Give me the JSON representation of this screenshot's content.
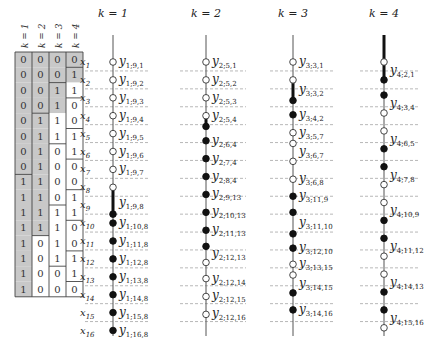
{
  "table": {
    "headers": [
      "k = 1",
      "k = 2",
      "k = 3",
      "k = 4"
    ],
    "rows": [
      [
        0,
        0,
        0,
        0
      ],
      [
        0,
        0,
        0,
        1
      ],
      [
        0,
        0,
        1,
        1
      ],
      [
        0,
        0,
        1,
        0
      ],
      [
        0,
        1,
        1,
        0
      ],
      [
        0,
        1,
        1,
        1
      ],
      [
        0,
        1,
        0,
        1
      ],
      [
        0,
        1,
        0,
        0
      ],
      [
        1,
        1,
        0,
        0
      ],
      [
        1,
        1,
        0,
        1
      ],
      [
        1,
        1,
        1,
        1
      ],
      [
        1,
        1,
        1,
        0
      ],
      [
        1,
        0,
        1,
        0
      ],
      [
        1,
        0,
        1,
        1
      ],
      [
        1,
        0,
        0,
        1
      ],
      [
        1,
        0,
        0,
        0
      ]
    ],
    "shade_color": "#c8c8c8"
  },
  "x_labels": [
    "x1",
    "x2",
    "x3",
    "x4",
    "x5",
    "x6",
    "x7",
    "x8",
    "x9",
    "x10",
    "x11",
    "x12",
    "x13",
    "x14",
    "x15",
    "x16"
  ],
  "columns": [
    {
      "title": "k = 1",
      "nodes": [
        {
          "row": 1,
          "type": "open",
          "label": "y1;9,1"
        },
        {
          "row": 2,
          "type": "open",
          "label": "y1;9,2"
        },
        {
          "row": 3,
          "type": "open",
          "label": "y1;9,3"
        },
        {
          "row": 4,
          "type": "open",
          "label": "y1;9,4"
        },
        {
          "row": 5,
          "type": "open",
          "label": "y1;9,5"
        },
        {
          "row": 6,
          "type": "open",
          "label": "y1;9,6"
        },
        {
          "row": 7,
          "type": "open",
          "label": "y1;9,7"
        },
        {
          "row": 8,
          "type": "open",
          "label": ""
        },
        {
          "row": 8.9,
          "type": "none",
          "label": "y1;9,8"
        },
        {
          "row": 9.5,
          "type": "filled",
          "label": ""
        },
        {
          "row": 10,
          "type": "filled",
          "label": "y1;10,8"
        },
        {
          "row": 11,
          "type": "filled",
          "label": "y1;11,8"
        },
        {
          "row": 12,
          "type": "filled",
          "label": "y1;12,8"
        },
        {
          "row": 13,
          "type": "filled",
          "label": "y1;13,8"
        },
        {
          "row": 14,
          "type": "filled",
          "label": "y1;14,8"
        },
        {
          "row": 15,
          "type": "filled",
          "label": "y1;15,8"
        },
        {
          "row": 16,
          "type": "filled",
          "label": "y1;16,8"
        }
      ],
      "thick_segments": [
        [
          8,
          9.5
        ]
      ]
    },
    {
      "title": "k = 2",
      "nodes": [
        {
          "row": 1,
          "type": "open",
          "label": "y2;5,1"
        },
        {
          "row": 2,
          "type": "open",
          "label": "y2;5,2"
        },
        {
          "row": 3,
          "type": "open",
          "label": "y2;5,3"
        },
        {
          "row": 4,
          "type": "open",
          "label": "y2;5,4"
        },
        {
          "row": 4.6,
          "type": "filled",
          "label": ""
        },
        {
          "row": 5.4,
          "type": "filled",
          "label": "y2;6,4"
        },
        {
          "row": 6.4,
          "type": "filled",
          "label": "y2;7,4"
        },
        {
          "row": 7.4,
          "type": "filled",
          "label": "y2;8,4"
        },
        {
          "row": 8.4,
          "type": "filled",
          "label": "y2;9,13"
        },
        {
          "row": 9.4,
          "type": "filled",
          "label": "y2;10,13"
        },
        {
          "row": 10.4,
          "type": "filled",
          "label": "y2;11,13"
        },
        {
          "row": 11.3,
          "type": "filled",
          "label": ""
        },
        {
          "row": 11.7,
          "type": "none",
          "label": "y2;12,13"
        },
        {
          "row": 12.2,
          "type": "open",
          "label": ""
        },
        {
          "row": 13.1,
          "type": "open",
          "label": "y2;12,14"
        },
        {
          "row": 14.1,
          "type": "open",
          "label": "y2;12,15"
        },
        {
          "row": 15.1,
          "type": "open",
          "label": "y2;12,16"
        }
      ],
      "thick_segments": [
        [
          4,
          4.6
        ]
      ]
    },
    {
      "title": "k = 3",
      "nodes": [
        {
          "row": 1,
          "type": "open",
          "label": "y3;3,1"
        },
        {
          "row": 2,
          "type": "open",
          "label": ""
        },
        {
          "row": 2.55,
          "type": "none",
          "label": "y3;3,2"
        },
        {
          "row": 3.15,
          "type": "filled",
          "label": ""
        },
        {
          "row": 3.95,
          "type": "filled",
          "label": "y3;4,2"
        },
        {
          "row": 4.95,
          "type": "open",
          "label": "y3;5,7"
        },
        {
          "row": 5.55,
          "type": "open",
          "label": ""
        },
        {
          "row": 6.05,
          "type": "none",
          "label": "y3;6,7"
        },
        {
          "row": 6.55,
          "type": "open",
          "label": ""
        },
        {
          "row": 7.55,
          "type": "open",
          "label": "y3;6,8"
        },
        {
          "row": 8.5,
          "type": "filled",
          "label": "y3;11,9"
        },
        {
          "row": 9.4,
          "type": "filled",
          "label": ""
        },
        {
          "row": 10.0,
          "type": "none",
          "label": "y3;11,10"
        },
        {
          "row": 10.6,
          "type": "filled",
          "label": ""
        },
        {
          "row": 11.4,
          "type": "filled",
          "label": "y3;12,10"
        },
        {
          "row": 12.3,
          "type": "open",
          "label": "y3;13,15"
        },
        {
          "row": 12.9,
          "type": "open",
          "label": ""
        },
        {
          "row": 13.4,
          "type": "none",
          "label": "y3;14,15"
        },
        {
          "row": 13.9,
          "type": "filled",
          "label": ""
        },
        {
          "row": 14.85,
          "type": "filled",
          "label": "y3;14,16"
        }
      ],
      "thick_segments": [
        [
          2,
          3.15
        ]
      ]
    },
    {
      "title": "k = 4",
      "nodes": [
        {
          "row": 1,
          "type": "open",
          "label": ""
        },
        {
          "row": 1.5,
          "type": "none",
          "label": "y4;2,1"
        },
        {
          "row": 2.0,
          "type": "filled",
          "label": ""
        },
        {
          "row": 2.85,
          "type": "filled",
          "label": ""
        },
        {
          "row": 3.35,
          "type": "none",
          "label": "y4;3,4"
        },
        {
          "row": 3.85,
          "type": "open",
          "label": ""
        },
        {
          "row": 4.85,
          "type": "open",
          "label": ""
        },
        {
          "row": 5.35,
          "type": "none",
          "label": "y4;6,5"
        },
        {
          "row": 5.85,
          "type": "filled",
          "label": ""
        },
        {
          "row": 6.85,
          "type": "filled",
          "label": ""
        },
        {
          "row": 7.35,
          "type": "none",
          "label": "y4;7,8"
        },
        {
          "row": 7.85,
          "type": "open",
          "label": ""
        },
        {
          "row": 8.85,
          "type": "open",
          "label": ""
        },
        {
          "row": 9.35,
          "type": "none",
          "label": "y4;10,9"
        },
        {
          "row": 9.85,
          "type": "filled",
          "label": ""
        },
        {
          "row": 10.85,
          "type": "filled",
          "label": ""
        },
        {
          "row": 11.35,
          "type": "none",
          "label": "y4;11,12"
        },
        {
          "row": 11.85,
          "type": "open",
          "label": ""
        },
        {
          "row": 12.85,
          "type": "open",
          "label": ""
        },
        {
          "row": 13.35,
          "type": "none",
          "label": "y4;14,13"
        },
        {
          "row": 13.85,
          "type": "filled",
          "label": ""
        },
        {
          "row": 14.85,
          "type": "filled",
          "label": ""
        },
        {
          "row": 15.35,
          "type": "none",
          "label": "y4;15,16"
        },
        {
          "row": 15.85,
          "type": "open",
          "label": ""
        }
      ],
      "thick_segments": [
        [
          -0.5,
          2.0
        ]
      ]
    }
  ]
}
